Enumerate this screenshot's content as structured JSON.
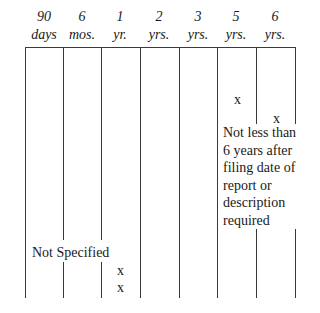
{
  "table": {
    "columns": [
      {
        "num": "90",
        "unit": "days"
      },
      {
        "num": "6",
        "unit": "mos."
      },
      {
        "num": "1",
        "unit": "yr."
      },
      {
        "num": "2",
        "unit": "yrs."
      },
      {
        "num": "3",
        "unit": "yrs."
      },
      {
        "num": "5",
        "unit": "yrs."
      },
      {
        "num": "6",
        "unit": "yrs."
      }
    ],
    "marks": {
      "col5_mark": "x",
      "col6_mark": "x",
      "col3_mark_a": "x",
      "col3_mark_b": "x"
    },
    "notes": {
      "six_years_note": [
        "Not less than",
        "6 years after",
        "filing date of",
        "report or",
        "description",
        "required"
      ],
      "not_specified": "Not Specified"
    }
  }
}
